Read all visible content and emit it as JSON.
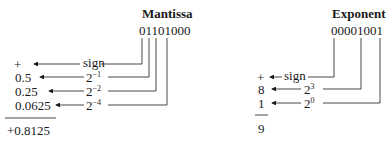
{
  "mantissa": {
    "title": "Mantissa",
    "bits": "01101000",
    "rows": [
      {
        "value": "+",
        "label": "sign",
        "exp": ""
      },
      {
        "value": "0.5",
        "label": "2",
        "exp": "−1"
      },
      {
        "value": "0.25",
        "label": "2",
        "exp": "−2"
      },
      {
        "value": "0.0625",
        "label": "2",
        "exp": "−4"
      }
    ],
    "total": "+0.8125"
  },
  "exponent": {
    "title": "Exponent",
    "bits": "00001001",
    "rows": [
      {
        "value": "+",
        "label": "sign",
        "exp": ""
      },
      {
        "value": "8",
        "label": "2",
        "exp": "3"
      },
      {
        "value": "1",
        "label": "2",
        "exp": "0"
      }
    ],
    "total": "9"
  }
}
